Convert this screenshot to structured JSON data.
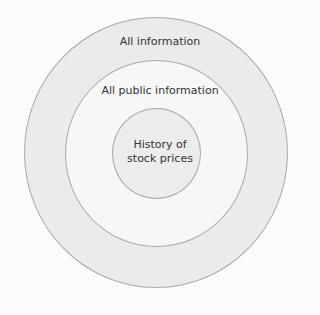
{
  "diagram": {
    "type": "concentric-circles",
    "title": "",
    "rings": [
      {
        "label": "All information",
        "fill": "#ebebeb"
      },
      {
        "label": "All public information",
        "fill": "#f7f7f7"
      },
      {
        "label_line1": "History of",
        "label_line2": "stock prices",
        "fill": "#ececec"
      }
    ],
    "border_color": "#a8a8a8",
    "background": "#fcfcfc"
  }
}
